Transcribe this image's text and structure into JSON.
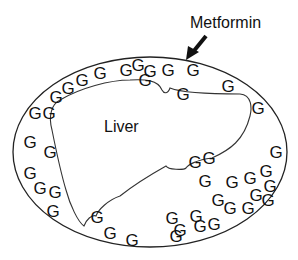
{
  "diagram": {
    "title_label": "Metformin",
    "organ_label": "Liver",
    "molecule_symbol": "G",
    "colors": {
      "stroke": "#222222",
      "text": "#111111",
      "background": "#ffffff"
    },
    "outer_boundary": {
      "cx": 150,
      "cy": 152,
      "rx": 137,
      "ry": 95
    },
    "arrow": {
      "from": [
        206,
        36
      ],
      "to": [
        188,
        58
      ]
    },
    "molecules": [
      {
        "x": 56,
        "y": 97
      },
      {
        "x": 68,
        "y": 88
      },
      {
        "x": 82,
        "y": 80
      },
      {
        "x": 100,
        "y": 73
      },
      {
        "x": 126,
        "y": 70
      },
      {
        "x": 138,
        "y": 65
      },
      {
        "x": 150,
        "y": 71
      },
      {
        "x": 145,
        "y": 80
      },
      {
        "x": 168,
        "y": 70
      },
      {
        "x": 193,
        "y": 70
      },
      {
        "x": 183,
        "y": 94
      },
      {
        "x": 228,
        "y": 86
      },
      {
        "x": 258,
        "y": 108
      },
      {
        "x": 35,
        "y": 113
      },
      {
        "x": 49,
        "y": 113
      },
      {
        "x": 30,
        "y": 142
      },
      {
        "x": 50,
        "y": 152
      },
      {
        "x": 30,
        "y": 173
      },
      {
        "x": 40,
        "y": 188
      },
      {
        "x": 55,
        "y": 192
      },
      {
        "x": 53,
        "y": 211
      },
      {
        "x": 97,
        "y": 217
      },
      {
        "x": 110,
        "y": 233
      },
      {
        "x": 132,
        "y": 240
      },
      {
        "x": 195,
        "y": 162
      },
      {
        "x": 209,
        "y": 158
      },
      {
        "x": 205,
        "y": 181
      },
      {
        "x": 232,
        "y": 182
      },
      {
        "x": 250,
        "y": 178
      },
      {
        "x": 266,
        "y": 171
      },
      {
        "x": 276,
        "y": 152
      },
      {
        "x": 218,
        "y": 200
      },
      {
        "x": 230,
        "y": 208
      },
      {
        "x": 248,
        "y": 208
      },
      {
        "x": 256,
        "y": 195
      },
      {
        "x": 270,
        "y": 186
      },
      {
        "x": 268,
        "y": 200
      },
      {
        "x": 172,
        "y": 218
      },
      {
        "x": 196,
        "y": 216
      },
      {
        "x": 180,
        "y": 230
      },
      {
        "x": 200,
        "y": 226
      },
      {
        "x": 214,
        "y": 224
      },
      {
        "x": 176,
        "y": 236
      }
    ]
  }
}
